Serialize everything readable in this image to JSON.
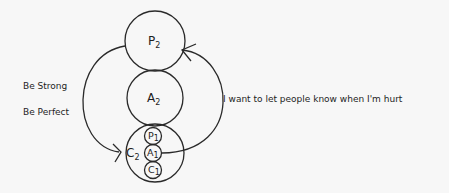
{
  "diagram": {
    "type": "transactional-analysis-ego-state",
    "ego_states": {
      "parent2": {
        "letter": "P",
        "sub": "2"
      },
      "adult2": {
        "letter": "A",
        "sub": "2"
      },
      "child2": {
        "letter": "C",
        "sub": "2"
      },
      "parent1": {
        "letter": "P",
        "sub": "1"
      },
      "adult1": {
        "letter": "A",
        "sub": "1"
      },
      "child1": {
        "letter": "C",
        "sub": "1"
      }
    },
    "left_labels": [
      "Be Strong",
      "Be Perfect"
    ],
    "right_label": "I want to let people know when I'm hurt",
    "stroke_color": "#2a2a2a",
    "background_color": "#f7f7f7"
  }
}
